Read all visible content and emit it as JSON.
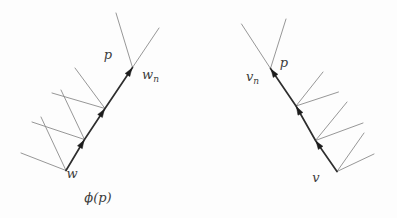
{
  "page": {
    "background": "#fdfdfd"
  },
  "diagram": {
    "canvas": {
      "width": 397,
      "height": 218
    },
    "styles": {
      "path_color": "#2e2e2e",
      "path_width": 1.7,
      "branch_color": "#8b8b8b",
      "branch_width": 0.9,
      "arrow_color": "#1c1c1c",
      "arrow_length": 8,
      "arrow_half_width": 2.8,
      "label_color": "#3c3c3c",
      "label_size": 13,
      "subscript_size": 9
    },
    "trees": [
      {
        "id": "left-tree",
        "path_points": [
          [
            66,
            170.5
          ],
          [
            84.5,
            139.5
          ],
          [
            105,
            108.5
          ],
          [
            132.5,
            67.5
          ]
        ],
        "branch_lines": [
          [
            66,
            170.5,
            21,
            153
          ],
          [
            66,
            170.5,
            41,
            117
          ],
          [
            84.5,
            139.5,
            32,
            122
          ],
          [
            84.5,
            139.5,
            61,
            90
          ],
          [
            105,
            108.5,
            52,
            93
          ],
          [
            105,
            108.5,
            75,
            68
          ],
          [
            132.5,
            67.5,
            116,
            13
          ],
          [
            132.5,
            67.5,
            159,
            28
          ]
        ],
        "labels": [
          {
            "name": "p-label-left",
            "text": "p",
            "sub": "",
            "x": 108,
            "y": 58.5,
            "anchor": "middle"
          },
          {
            "name": "wn-label",
            "text": "w",
            "sub": "n",
            "x": 142,
            "y": 79,
            "anchor": "start"
          },
          {
            "name": "w-label",
            "text": "w",
            "sub": "",
            "x": 72,
            "y": 178,
            "anchor": "middle"
          },
          {
            "name": "phi-p-label",
            "text": "ϕ(p)",
            "sub": "",
            "x": 98,
            "y": 201.5,
            "anchor": "middle"
          }
        ]
      },
      {
        "id": "right-tree",
        "path_points": [
          [
            337,
            171.5
          ],
          [
            315.5,
            140.5
          ],
          [
            296,
            106
          ],
          [
            270.5,
            68.5
          ]
        ],
        "branch_lines": [
          [
            337,
            171.5,
            374,
            154
          ],
          [
            337,
            171.5,
            364,
            133
          ],
          [
            315.5,
            140.5,
            363,
            123
          ],
          [
            315.5,
            140.5,
            347,
            102
          ],
          [
            296,
            106,
            338.5,
            92
          ],
          [
            296,
            106,
            323,
            72
          ],
          [
            270.5,
            68.5,
            241.5,
            24
          ],
          [
            270.5,
            68.5,
            286,
            19
          ]
        ],
        "labels": [
          {
            "name": "p-label-right",
            "text": "p",
            "sub": "",
            "x": 284,
            "y": 66.5,
            "anchor": "middle"
          },
          {
            "name": "vn-label",
            "text": "v",
            "sub": "n",
            "x": 246,
            "y": 81,
            "anchor": "start"
          },
          {
            "name": "v-label",
            "text": "v",
            "sub": "",
            "x": 316,
            "y": 182,
            "anchor": "middle"
          }
        ]
      }
    ]
  }
}
